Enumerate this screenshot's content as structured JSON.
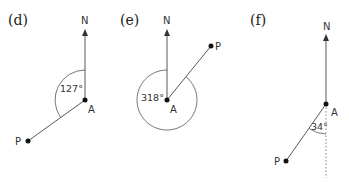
{
  "diagrams": [
    {
      "id": "d",
      "label": "(d)",
      "north_label": "N",
      "point_a_label": "A",
      "point_p_label": "P",
      "angle_label": "127°",
      "bearing_degrees": 127,
      "angle_type": "reflex-from-north-anticlockwise"
    },
    {
      "id": "e",
      "label": "(e)",
      "north_label": "N",
      "point_a_label": "A",
      "point_p_label": "P",
      "angle_label": "318°",
      "bearing_degrees": 318,
      "angle_type": "full-circle-arc"
    },
    {
      "id": "f",
      "label": "(f)",
      "north_label": "N",
      "point_a_label": "A",
      "point_p_label": "P",
      "angle_label": "34°",
      "bearing_degrees": 34,
      "angle_type": "from-south-dotted"
    }
  ],
  "colors": {
    "line": "#444444",
    "point": "#111111",
    "text": "#222222",
    "background": "#ffffff"
  }
}
